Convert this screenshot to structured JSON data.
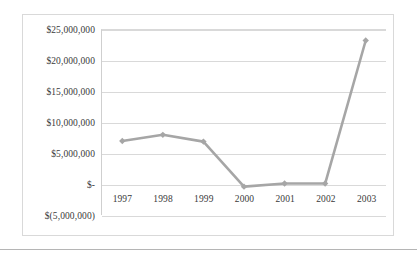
{
  "chart_data": {
    "type": "line",
    "title": "",
    "subtitle": "",
    "xlabel": "",
    "ylabel": "",
    "categories": [
      "1997",
      "1998",
      "1999",
      "2000",
      "2001",
      "2002",
      "2003"
    ],
    "values": [
      7000000,
      8000000,
      6900000,
      -400000,
      100000,
      100000,
      23300000
    ],
    "series": [
      {
        "name": "Series 1",
        "values": [
          7000000,
          8000000,
          6900000,
          -400000,
          100000,
          100000,
          23300000
        ]
      }
    ],
    "ylim": [
      -5000000,
      25000000
    ],
    "ytick_values": [
      25000000,
      20000000,
      15000000,
      10000000,
      5000000,
      0,
      -5000000
    ],
    "ytick_labels": [
      "$25,000,000",
      "$20,000,000",
      "$15,000,000",
      "$10,000,000",
      "$5,000,000",
      "$-",
      "$(5,000,000)"
    ],
    "grid": true,
    "legend": false,
    "legend_position": "none",
    "marker": "diamond",
    "annotations": []
  },
  "style": {
    "series_color": "#a6a6a6",
    "gridline_color": "#d9d9d9",
    "frame_color": "#d9d9d9",
    "axis_color": "#cfcfcf",
    "text_color": "#3a3a3a",
    "background": "#ffffff"
  }
}
